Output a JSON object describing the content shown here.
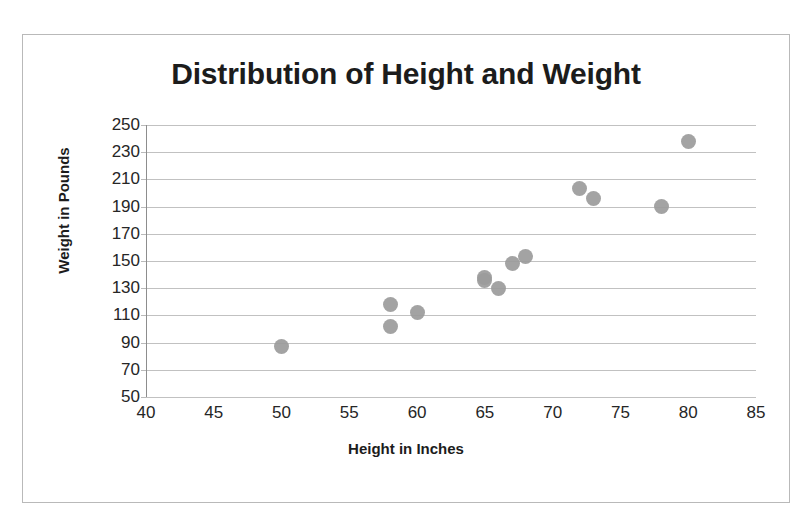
{
  "chart_data": {
    "type": "scatter",
    "title": "Distribution of Height and Weight",
    "xlabel": "Height in Inches",
    "ylabel": "Weight in Pounds",
    "xlim": [
      40,
      85
    ],
    "ylim": [
      50,
      250
    ],
    "xticks": [
      40,
      45,
      50,
      55,
      60,
      65,
      70,
      75,
      80,
      85
    ],
    "yticks": [
      50,
      70,
      90,
      110,
      130,
      150,
      170,
      190,
      210,
      230,
      250
    ],
    "grid": "horizontal",
    "legend": "none",
    "marker_color": "#9b9b9b",
    "points": [
      {
        "x": 50,
        "y": 87
      },
      {
        "x": 58,
        "y": 118
      },
      {
        "x": 58,
        "y": 102
      },
      {
        "x": 60,
        "y": 112
      },
      {
        "x": 65,
        "y": 138
      },
      {
        "x": 65,
        "y": 136
      },
      {
        "x": 66,
        "y": 130
      },
      {
        "x": 67,
        "y": 148
      },
      {
        "x": 68,
        "y": 153
      },
      {
        "x": 72,
        "y": 203
      },
      {
        "x": 73,
        "y": 196
      },
      {
        "x": 78,
        "y": 190
      },
      {
        "x": 80,
        "y": 238
      }
    ]
  }
}
